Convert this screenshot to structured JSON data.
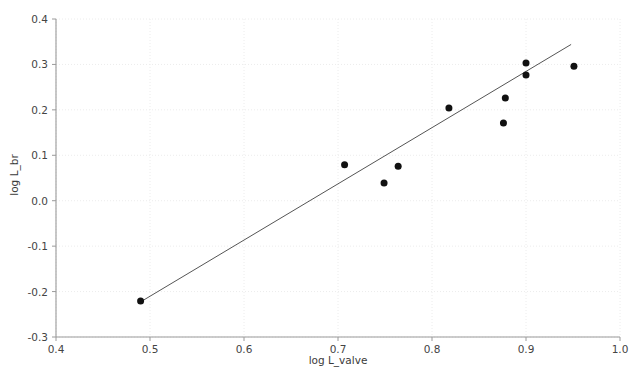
{
  "chart_data": {
    "type": "scatter",
    "title": "",
    "xlabel": "log L_valve",
    "ylabel": "log L_br",
    "xlim": [
      0.4,
      1.0
    ],
    "ylim": [
      -0.3,
      0.4
    ],
    "xticks": [
      "0.4",
      "0.5",
      "0.6",
      "0.7",
      "0.8",
      "0.9",
      "1.0"
    ],
    "xtick_values": [
      0.4,
      0.5,
      0.6,
      0.7,
      0.8,
      0.9,
      1.0
    ],
    "yticks": [
      "0.4",
      "0.3",
      "0.2",
      "0.1",
      "0.0",
      "-0.1",
      "-0.2",
      "-0.3"
    ],
    "ytick_values": [
      0.4,
      0.3,
      0.2,
      0.1,
      0.0,
      -0.1,
      -0.2,
      -0.3
    ],
    "grid": true,
    "legend": "none",
    "marker_color": "#111111",
    "marker_size": 4.6,
    "line_color": "#555555",
    "grid_color": "#ececec",
    "axis_color": "#9a9a9a",
    "background": "#ffffff",
    "x": [
      0.49,
      0.707,
      0.749,
      0.764,
      0.818,
      0.876,
      0.878,
      0.9,
      0.9,
      0.951
    ],
    "y": [
      -0.221,
      0.079,
      0.039,
      0.076,
      0.204,
      0.171,
      0.226,
      0.277,
      0.303,
      0.296
    ],
    "points": [
      {
        "x": 0.49,
        "y": -0.221
      },
      {
        "x": 0.707,
        "y": 0.079
      },
      {
        "x": 0.749,
        "y": 0.039
      },
      {
        "x": 0.764,
        "y": 0.076
      },
      {
        "x": 0.818,
        "y": 0.204
      },
      {
        "x": 0.876,
        "y": 0.171
      },
      {
        "x": 0.878,
        "y": 0.226
      },
      {
        "x": 0.9,
        "y": 0.277
      },
      {
        "x": 0.9,
        "y": 0.303
      },
      {
        "x": 0.951,
        "y": 0.296
      }
    ],
    "series": [
      {
        "name": "observations",
        "type": "scatter",
        "x": [
          0.49,
          0.707,
          0.749,
          0.764,
          0.818,
          0.876,
          0.878,
          0.9,
          0.9,
          0.951
        ],
        "y": [
          -0.221,
          0.079,
          0.039,
          0.076,
          0.204,
          0.171,
          0.226,
          0.277,
          0.303,
          0.296
        ]
      },
      {
        "name": "fit-line",
        "type": "line",
        "x": [
          0.493,
          0.948
        ],
        "y": [
          -0.219,
          0.344
        ]
      }
    ],
    "fit_line": {
      "x0": 0.493,
      "y0": -0.219,
      "x1": 0.948,
      "y1": 0.344,
      "slope": 1.237,
      "intercept": -0.829
    }
  }
}
